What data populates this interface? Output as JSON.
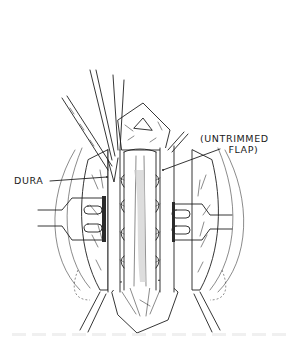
{
  "figure": {
    "type": "surgical-illustration",
    "labels": {
      "dura": "DURA",
      "flap_line1": "(UNTRIMMED",
      "flap_line2": "FLAP)"
    },
    "colors": {
      "ink": "#1f1f1f",
      "background": "#ffffff"
    }
  }
}
